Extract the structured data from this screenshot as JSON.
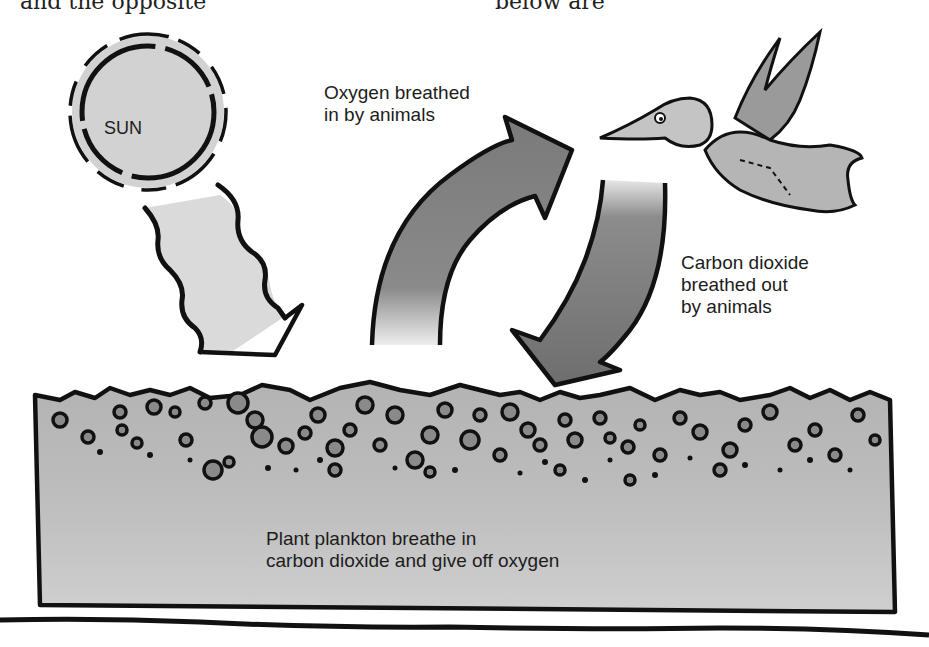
{
  "header_fragment": {
    "left_text": "and the opposite",
    "right_text": "below are"
  },
  "sun": {
    "label": "SUN"
  },
  "labels": {
    "oxygen": [
      "Oxygen breathed",
      "in by animals"
    ],
    "carbon_dioxide": [
      "Carbon dioxide",
      "breathed out",
      "by animals"
    ],
    "plankton": [
      "Plant plankton breathe in",
      "carbon dioxide and give off oxygen"
    ]
  },
  "colors": {
    "ink": "#111111",
    "sun_fill": "#d4d4d4",
    "sunbeam_fill": "#dcdcdc",
    "arrow_fill": "#7d7d7d",
    "bird_fill": "#b5b5b5",
    "water_fill": "#c3c3c3",
    "plankton_fill": "#8a8a8a"
  }
}
